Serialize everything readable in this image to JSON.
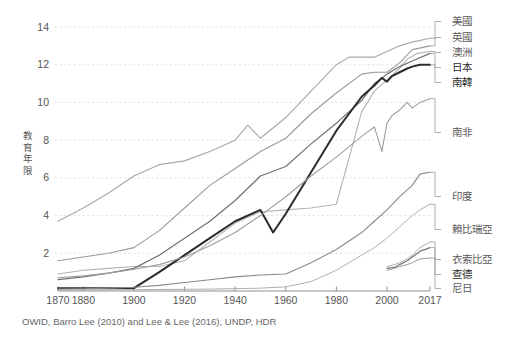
{
  "caption": "OWID, Barro Lee (2010) and Lee & Lee (2016), UNDP, HDR",
  "axis": {
    "y_title": "教育年限",
    "y_title_chars": [
      "教",
      "育",
      "年",
      "限"
    ],
    "y_ticks": [
      "2",
      "4",
      "6",
      "8",
      "10",
      "12",
      "14"
    ],
    "x_ticks": [
      "1870",
      "1880",
      "1900",
      "1920",
      "1940",
      "1960",
      "1980",
      "2000",
      "2017"
    ]
  },
  "legend": [
    {
      "label": "美國",
      "color": "#a8a8a8"
    },
    {
      "label": "英國",
      "color": "#9a9a9a"
    },
    {
      "label": "澳洲",
      "color": "#b4b4b4"
    },
    {
      "label": "日本",
      "color": "#707070"
    },
    {
      "label": "南韓",
      "color": "#2b2b2b"
    },
    {
      "label": "南非",
      "color": "#9e9e9e"
    },
    {
      "label": "印度",
      "color": "#8a8a8a"
    },
    {
      "label": "賴比瑞亞",
      "color": "#b0b0b0"
    },
    {
      "label": "衣索比亞",
      "color": "#b0b0b0"
    },
    {
      "label": "查德",
      "color": "#777777"
    },
    {
      "label": "尼日",
      "color": "#9a9a9a"
    }
  ],
  "chart_data": {
    "type": "line",
    "title": "",
    "subtitle": "",
    "xlabel": "",
    "ylabel": "教育年限",
    "source": "OWID, Barro Lee (2010) and Lee & Lee (2016), UNDP, HDR",
    "xlim": [
      1870,
      2017
    ],
    "ylim": [
      0,
      14.8
    ],
    "grid": "horizontal-dotted",
    "legend_position": "right-inline-labels",
    "x_tick_values": [
      1870,
      1880,
      1900,
      1920,
      1940,
      1960,
      1980,
      2000,
      2017
    ],
    "y_tick_values": [
      2,
      4,
      6,
      8,
      10,
      12,
      14
    ],
    "series": [
      {
        "name": "美國",
        "color": "#a8a8a8",
        "width": 1.1,
        "label_y": 14.05,
        "x": [
          1870,
          1880,
          1890,
          1900,
          1910,
          1920,
          1930,
          1940,
          1945,
          1950,
          1960,
          1970,
          1980,
          1985,
          1990,
          1995,
          2000,
          2005,
          2010,
          2017
        ],
        "values": [
          3.7,
          4.4,
          5.2,
          6.1,
          6.7,
          6.9,
          7.4,
          8.0,
          8.8,
          8.1,
          9.2,
          10.6,
          12.0,
          12.4,
          12.4,
          12.4,
          12.7,
          13.0,
          13.2,
          13.4
        ]
      },
      {
        "name": "英國",
        "color": "#9a9a9a",
        "width": 1.1,
        "label_y": 13.15,
        "x": [
          1870,
          1880,
          1890,
          1900,
          1910,
          1920,
          1930,
          1940,
          1950,
          1960,
          1970,
          1980,
          1990,
          1995,
          2000,
          2005,
          2010,
          2017
        ],
        "values": [
          1.6,
          1.8,
          2.0,
          2.3,
          3.2,
          4.4,
          5.6,
          6.5,
          7.4,
          8.1,
          9.4,
          10.5,
          11.5,
          11.6,
          11.6,
          12.1,
          12.8,
          13.0
        ]
      },
      {
        "name": "澳洲",
        "color": "#b4b4b4",
        "width": 1.1,
        "label_y": 12.55,
        "x": [
          1870,
          1880,
          1890,
          1900,
          1910,
          1920,
          1930,
          1940,
          1950,
          1960,
          1970,
          1980,
          1990,
          1995,
          2000,
          2005,
          2008,
          2012,
          2017
        ],
        "values": [
          0.9,
          1.1,
          1.2,
          1.3,
          1.3,
          1.6,
          2.6,
          3.6,
          4.2,
          4.3,
          4.4,
          4.6,
          9.5,
          10.6,
          11.2,
          11.8,
          12.3,
          12.6,
          12.7
        ]
      },
      {
        "name": "日本",
        "color": "#707070",
        "width": 1.2,
        "label_y": 11.9,
        "x": [
          1870,
          1880,
          1890,
          1900,
          1910,
          1920,
          1930,
          1940,
          1950,
          1960,
          1970,
          1980,
          1990,
          1995,
          2000,
          2005,
          2010,
          2017
        ],
        "values": [
          0.6,
          0.75,
          0.95,
          1.2,
          1.9,
          2.8,
          3.7,
          4.8,
          6.1,
          6.6,
          7.8,
          8.9,
          10.1,
          11.0,
          11.5,
          11.9,
          12.2,
          12.6
        ]
      },
      {
        "name": "南韓",
        "color": "#2b2b2b",
        "width": 2.0,
        "label_y": 11.25,
        "x": [
          1870,
          1880,
          1890,
          1900,
          1910,
          1920,
          1930,
          1940,
          1950,
          1955,
          1960,
          1965,
          1970,
          1975,
          1980,
          1985,
          1990,
          1995,
          1998,
          2000,
          2002,
          2005,
          2008,
          2010,
          2013,
          2017
        ],
        "values": [
          0.15,
          0.15,
          0.15,
          0.15,
          1.0,
          1.9,
          2.8,
          3.7,
          4.3,
          3.1,
          4.1,
          5.2,
          6.3,
          7.4,
          8.5,
          9.4,
          10.3,
          10.9,
          11.3,
          11.1,
          11.4,
          11.6,
          11.8,
          11.9,
          12.0,
          12.0
        ]
      },
      {
        "name": "南非",
        "color": "#9e9e9e",
        "width": 1.1,
        "label_y": 10.05,
        "x": [
          1870,
          1880,
          1890,
          1900,
          1910,
          1920,
          1930,
          1940,
          1950,
          1960,
          1970,
          1980,
          1990,
          1995,
          1998,
          2000,
          2002,
          2005,
          2008,
          2010,
          2013,
          2017
        ],
        "values": [
          0.7,
          0.8,
          0.95,
          1.15,
          1.4,
          1.8,
          2.4,
          3.1,
          4.0,
          5.0,
          6.1,
          7.1,
          8.2,
          8.7,
          7.4,
          8.9,
          9.3,
          9.6,
          10.0,
          9.7,
          10.0,
          10.2
        ]
      },
      {
        "name": "印度",
        "color": "#8a8a8a",
        "width": 1.1,
        "label_y": 6.15,
        "x": [
          1870,
          1880,
          1890,
          1900,
          1910,
          1920,
          1930,
          1940,
          1950,
          1960,
          1970,
          1980,
          1990,
          1995,
          2000,
          2005,
          2010,
          2013,
          2017
        ],
        "values": [
          0.1,
          0.12,
          0.15,
          0.2,
          0.3,
          0.45,
          0.6,
          0.75,
          0.85,
          0.9,
          1.5,
          2.2,
          3.1,
          3.7,
          4.3,
          5.0,
          5.6,
          6.2,
          6.3
        ]
      },
      {
        "name": "賴比瑞亞",
        "color": "#b0b0b0",
        "width": 1.0,
        "label_y": 4.4,
        "x": [
          1870,
          1890,
          1910,
          1930,
          1950,
          1960,
          1970,
          1980,
          1990,
          1995,
          2000,
          2005,
          2010,
          2013,
          2017
        ],
        "values": [
          0.05,
          0.06,
          0.08,
          0.1,
          0.15,
          0.22,
          0.5,
          1.1,
          1.9,
          2.3,
          2.8,
          3.4,
          4.0,
          4.3,
          4.6
        ]
      },
      {
        "name": "衣索比亞",
        "color": "#b0b0b0",
        "width": 1.0,
        "label_y": 2.55,
        "x": [
          2000,
          2003,
          2005,
          2008,
          2010,
          2013,
          2017
        ],
        "values": [
          1.3,
          1.4,
          1.5,
          1.7,
          1.9,
          2.3,
          2.6
        ]
      },
      {
        "name": "查德",
        "color": "#777777",
        "width": 1.2,
        "label_y": 2.0,
        "x": [
          2000,
          2003,
          2005,
          2008,
          2010,
          2013,
          2017
        ],
        "values": [
          1.2,
          1.25,
          1.4,
          1.6,
          1.8,
          2.1,
          2.3
        ]
      },
      {
        "name": "尼日",
        "color": "#9a9a9a",
        "width": 1.0,
        "label_y": 1.45,
        "x": [
          2000,
          2003,
          2005,
          2008,
          2010,
          2013,
          2017
        ],
        "values": [
          1.1,
          1.2,
          1.3,
          1.4,
          1.5,
          1.7,
          1.75
        ]
      }
    ]
  }
}
